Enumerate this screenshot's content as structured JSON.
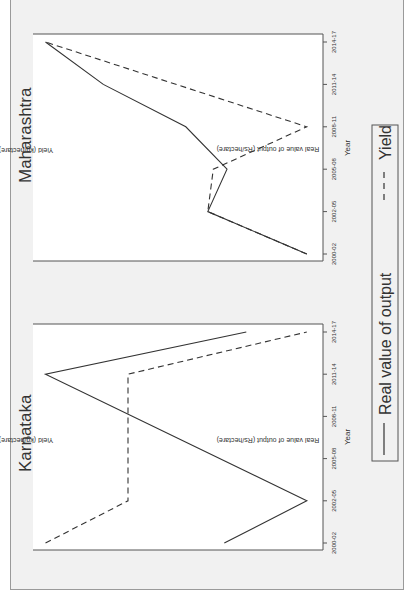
{
  "figure": {
    "background": "#f1f1f1",
    "line_color": "#333333",
    "orientation": "rotated -90deg (landscape figure shown in portrait)"
  },
  "legend": {
    "entries": [
      {
        "label": "Real value of output",
        "style": "solid"
      },
      {
        "label": "Yield",
        "style": "dashed"
      }
    ]
  },
  "panels": [
    {
      "title": "Maharashtra",
      "xlabel": "Year",
      "ylabel_left": "Real value of output (Rs/hectare)",
      "ylabel_right": "Yield (kg/hectare)",
      "ticks": [
        "2000-02",
        "2002-05",
        "2005-08",
        "2008-11",
        "2011-14",
        "2014-17"
      ]
    },
    {
      "title": "Karnataka",
      "xlabel": "Year",
      "ylabel_left": "Real value of output (Rs/hectare)",
      "ylabel_right": "Yield (kg/hectare)",
      "ticks": [
        "2000-02",
        "2002-05",
        "2005-08",
        "2008-11",
        "2011-14",
        "2014-17"
      ]
    }
  ],
  "chart_data": [
    {
      "type": "line",
      "title": "Maharashtra",
      "xlabel": "Year",
      "ylabel": "Real value of output (Rs/hectare)",
      "ylabel_secondary": "Yield (kg/hectare)",
      "x": [
        "2000-02",
        "2002-05",
        "2005-08",
        "2008-11",
        "2011-14",
        "2014-17"
      ],
      "note": "No numeric y ticks shown; values are normalized positions (0=min, 1=max of plot range)",
      "series": [
        {
          "name": "Real value of output",
          "style": "solid",
          "x": [
            "2000-02",
            "2002-05",
            "2005-08",
            "2008-11",
            "2011-14",
            "2014-17"
          ],
          "values": [
            0.03,
            0.39,
            0.32,
            0.47,
            0.77,
            0.98
          ]
        },
        {
          "name": "Yield",
          "style": "dashed",
          "x": [
            "2000-02",
            "2002-05",
            "2005-08",
            "2008-11",
            "2014-17"
          ],
          "values": [
            0.03,
            0.39,
            0.37,
            0.03,
            0.98
          ]
        }
      ],
      "ylim": [
        0,
        1
      ],
      "grid": false,
      "legend_position": "bottom (shared)"
    },
    {
      "type": "line",
      "title": "Karnataka",
      "xlabel": "Year",
      "ylabel": "Real value of output (Rs/hectare)",
      "ylabel_secondary": "Yield (kg/hectare)",
      "x": [
        "2000-02",
        "2002-05",
        "2005-08",
        "2008-11",
        "2011-14",
        "2014-17"
      ],
      "note": "No numeric y ticks shown; values are normalized positions (0=min, 1=max of plot range)",
      "series": [
        {
          "name": "Real value of output",
          "style": "solid",
          "x": [
            "2000-02",
            "2002-05",
            "2011-14",
            "2014-17"
          ],
          "values": [
            0.33,
            0.03,
            0.98,
            0.25
          ]
        },
        {
          "name": "Yield",
          "style": "dashed",
          "x": [
            "2000-02",
            "2002-05",
            "2011-14",
            "2014-17"
          ],
          "values": [
            0.98,
            0.68,
            0.68,
            0.03
          ]
        }
      ],
      "ylim": [
        0,
        1
      ],
      "grid": false,
      "legend_position": "bottom (shared)"
    }
  ]
}
